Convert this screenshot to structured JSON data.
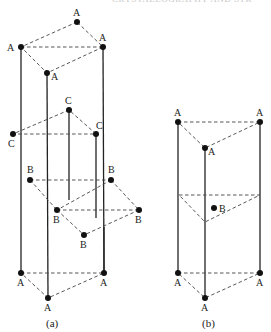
{
  "header": {
    "text": "CRYSTALLOGRAPHY AND STR"
  },
  "figures": [
    {
      "id": "a",
      "caption": "(a)",
      "layers": [
        {
          "name": "A-top",
          "label": "A",
          "points": [
            [
              77,
              22
            ],
            [
              21,
              47
            ],
            [
              103,
              47
            ],
            [
              47,
              73
            ]
          ]
        },
        {
          "name": "C",
          "label": "C",
          "points": [
            [
              69,
              110
            ],
            [
              13,
              134
            ],
            [
              96,
              134
            ]
          ]
        },
        {
          "name": "B-upper",
          "label": "B",
          "points": [
            [
              30,
              180
            ],
            [
              111,
              180
            ]
          ]
        },
        {
          "name": "B-lower",
          "label": "B",
          "points": [
            [
              57,
              210
            ],
            [
              139,
              210
            ],
            [
              84,
              235
            ]
          ]
        },
        {
          "name": "A-bottom",
          "label": "A",
          "points": [
            [
              21,
              273
            ],
            [
              104,
              273
            ],
            [
              48,
              298
            ]
          ]
        }
      ]
    },
    {
      "id": "b",
      "caption": "(b)",
      "layers": [
        {
          "name": "A-top",
          "label": "A",
          "points": [
            [
              178,
              122
            ],
            [
              260,
              122
            ],
            [
              205,
              148
            ]
          ]
        },
        {
          "name": "B-mid",
          "label": "B",
          "points": [
            [
              214,
              208
            ]
          ]
        },
        {
          "name": "A-bottom",
          "label": "A",
          "points": [
            [
              178,
              273
            ],
            [
              260,
              273
            ],
            [
              205,
              298
            ]
          ]
        }
      ]
    }
  ],
  "labels": {
    "A": "A",
    "B": "B",
    "C": "C",
    "cap_a": "(a)",
    "cap_b": "(b)"
  }
}
